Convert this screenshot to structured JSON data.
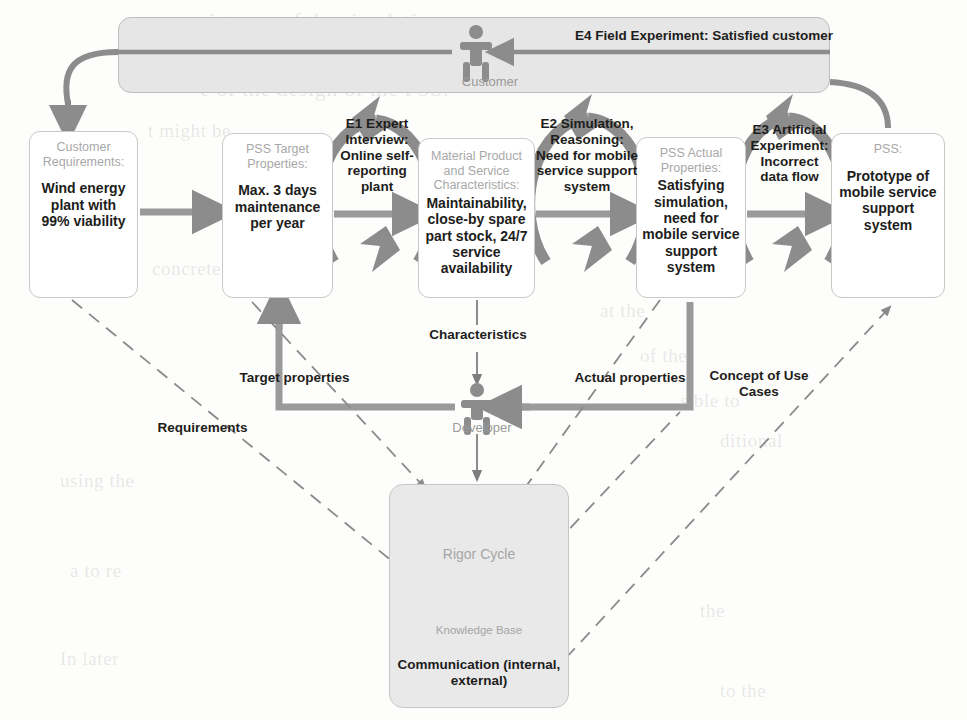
{
  "customer_lane": {
    "actor_label": "Customer",
    "e4_label": "E4 Field Experiment: Satisfied customer"
  },
  "developer": {
    "actor_label": "Developer"
  },
  "nodes": [
    {
      "id": "customer-requirements",
      "title": "Customer Requirements:",
      "body": "Wind energy plant with 99% viability"
    },
    {
      "id": "pss-target-properties",
      "title": "PSS Target Properties:",
      "body": "Max. 3 days maintenance per year"
    },
    {
      "id": "material-product-service-characteristics",
      "title": "Material Product and Service Characteristics:",
      "body": "Maintainability, close-by spare part stock, 24/7 service availability"
    },
    {
      "id": "pss-actual-properties",
      "title": "PSS Actual Properties:",
      "body": "Satisfying simulation, need for mobile service support system"
    },
    {
      "id": "pss",
      "title": "PSS:",
      "body": "Prototype of mobile service support system"
    }
  ],
  "experiment_labels": [
    {
      "id": "e1",
      "text": "E1 Expert Interview: Online self-reporting plant"
    },
    {
      "id": "e2",
      "text": "E2 Simulation, Reasoning: Need for mobile service support system"
    },
    {
      "id": "e3",
      "text": "E3 Artificial Experiment: Incorrect data flow"
    }
  ],
  "flow_labels": [
    {
      "id": "characteristics",
      "text": "Characteristics"
    },
    {
      "id": "target-properties",
      "text": "Target properties"
    },
    {
      "id": "actual-properties",
      "text": "Actual properties"
    },
    {
      "id": "requirements",
      "text": "Requirements"
    },
    {
      "id": "concept-of-use-cases",
      "text": "Concept of Use Cases"
    }
  ],
  "rigor": {
    "cycle_label": "Rigor Cycle",
    "knowledge_base_label": "Knowledge Base",
    "communication_label": "Communication (internal, external)"
  },
  "colors": {
    "arrow_gray": "#8c8c8c",
    "lane_fill": "#e6e6e6",
    "box_border": "#c9c9c9",
    "title_gray": "#a8a8a8",
    "text_black": "#1d1d1b",
    "dashed_gray": "#8a8a8a"
  },
  "background_text": [
    "sistency of the simulation w",
    "uld be impacted by specific",
    "e of the design of the PSS.",
    "t might be",
    "concrete",
    "at the",
    "of the",
    "sible to",
    "ditional",
    "using the",
    "a to re",
    "the",
    "In later",
    "to the"
  ]
}
